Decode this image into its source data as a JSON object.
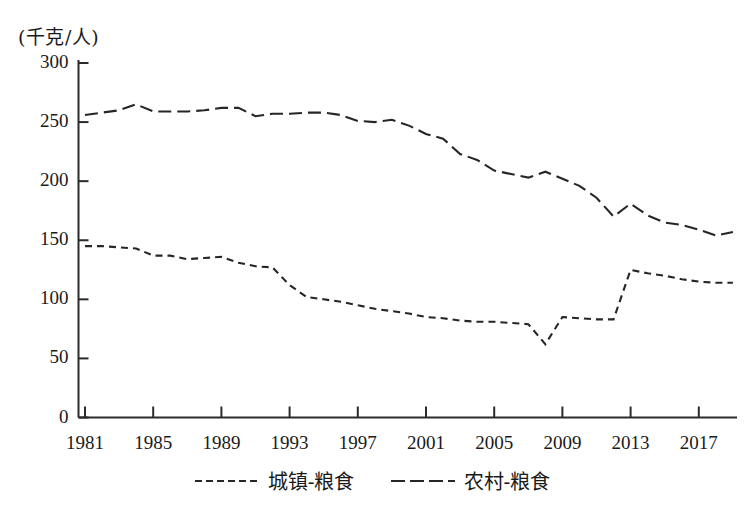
{
  "chart_data": {
    "type": "line",
    "title": "",
    "subtitle": "",
    "xlabel": "",
    "ylabel": "(千克/人)",
    "yunit_label": "(千克/人)",
    "xlim": [
      1981,
      2019
    ],
    "ylim": [
      0,
      300
    ],
    "ytick_values": [
      0,
      50,
      100,
      150,
      200,
      250,
      300
    ],
    "ytick_labels": [
      "0",
      "50",
      "100",
      "150",
      "200",
      "250",
      "300"
    ],
    "xtick_values": [
      1981,
      1985,
      1989,
      1993,
      1997,
      2001,
      2005,
      2009,
      2013,
      2017
    ],
    "xtick_labels": [
      "1981",
      "1985",
      "1989",
      "1993",
      "1997",
      "2001",
      "2005",
      "2009",
      "2013",
      "2017"
    ],
    "grid": false,
    "legend_position": "bottom-center",
    "x": [
      1981,
      1982,
      1983,
      1984,
      1985,
      1986,
      1987,
      1988,
      1989,
      1990,
      1991,
      1992,
      1993,
      1994,
      1995,
      1996,
      1997,
      1998,
      1999,
      2000,
      2001,
      2002,
      2003,
      2004,
      2005,
      2006,
      2007,
      2008,
      2009,
      2010,
      2011,
      2012,
      2013,
      2014,
      2015,
      2016,
      2017,
      2018,
      2019
    ],
    "series": [
      {
        "name": "城镇-粮食",
        "key": "urban",
        "linestyle": "dashed",
        "dash": "short",
        "color": "#262626",
        "values": [
          145,
          145,
          144,
          143,
          137,
          137,
          134,
          135,
          136,
          131,
          128,
          127,
          112,
          102,
          100,
          98,
          95,
          92,
          90,
          88,
          85,
          84,
          82,
          81,
          81,
          80,
          79,
          62,
          85,
          84,
          83,
          83,
          125,
          122,
          120,
          117,
          115,
          114,
          114
        ]
      },
      {
        "name": "农村-粮食",
        "key": "rural",
        "linestyle": "dashed",
        "dash": "long",
        "color": "#262626",
        "values": [
          256,
          258,
          260,
          265,
          259,
          259,
          259,
          260,
          262,
          262,
          255,
          257,
          257,
          258,
          258,
          256,
          251,
          250,
          252,
          247,
          240,
          236,
          223,
          218,
          209,
          206,
          203,
          208,
          202,
          196,
          186,
          170,
          181,
          171,
          165,
          163,
          159,
          154,
          157
        ]
      }
    ]
  },
  "legend": {
    "entries": [
      {
        "label": "城镇-粮食",
        "style": "urban"
      },
      {
        "label": "农村-粮食",
        "style": "rural"
      }
    ]
  },
  "axes": {
    "y_unit": "(千克/人)"
  }
}
